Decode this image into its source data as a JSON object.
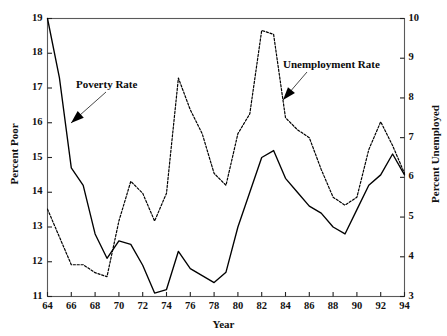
{
  "chart_data": {
    "type": "line",
    "title": "",
    "xlabel": "Year",
    "ylabel": "Percent Poor",
    "ylabel_right": "Percent Unemployed",
    "grid": false,
    "legend_position": "inline-annotations",
    "xlim": [
      64,
      94
    ],
    "ylim": [
      11,
      19
    ],
    "ylim_right": [
      3,
      10
    ],
    "xticks": [
      "64",
      "66",
      "68",
      "70",
      "72",
      "74",
      "76",
      "78",
      "80",
      "82",
      "84",
      "86",
      "88",
      "90",
      "92",
      "94"
    ],
    "yticks_left": [
      "11",
      "12",
      "13",
      "14",
      "15",
      "16",
      "17",
      "18",
      "19"
    ],
    "yticks_right": [
      "3",
      "4",
      "5",
      "6",
      "7",
      "8",
      "9",
      "10"
    ],
    "x": [
      1964,
      1965,
      1966,
      1967,
      1968,
      1969,
      1970,
      1971,
      1972,
      1973,
      1974,
      1975,
      1976,
      1977,
      1978,
      1979,
      1980,
      1981,
      1982,
      1983,
      1984,
      1985,
      1986,
      1987,
      1988,
      1989,
      1990,
      1991,
      1992,
      1993,
      1994
    ],
    "series": [
      {
        "name": "Poverty Rate",
        "axis": "left",
        "style": "solid",
        "color": "#000000",
        "values": [
          19.0,
          17.3,
          14.7,
          14.2,
          12.8,
          12.1,
          12.6,
          12.5,
          11.9,
          11.1,
          11.2,
          12.3,
          11.8,
          11.6,
          11.4,
          11.7,
          13.0,
          14.0,
          15.0,
          15.2,
          14.4,
          14.0,
          13.6,
          13.4,
          13.0,
          12.8,
          13.5,
          14.2,
          14.5,
          15.1,
          14.5
        ]
      },
      {
        "name": "Unemployment Rate",
        "axis": "right",
        "style": "dashed",
        "color": "#000000",
        "values": [
          5.2,
          4.5,
          3.8,
          3.8,
          3.6,
          3.5,
          4.9,
          5.9,
          5.6,
          4.9,
          5.6,
          8.5,
          7.7,
          7.1,
          6.1,
          5.8,
          7.1,
          7.6,
          9.7,
          9.6,
          7.5,
          7.2,
          7.0,
          6.2,
          5.5,
          5.3,
          5.5,
          6.7,
          7.4,
          6.8,
          6.1
        ]
      }
    ],
    "annotations": [
      {
        "name": "poverty-rate-label",
        "text": "Poverty Rate",
        "x_px": 76,
        "y_px": 78
      },
      {
        "name": "unemployment-rate-label",
        "text": "Unemployment Rate",
        "x_px": 283,
        "y_px": 58
      }
    ]
  },
  "axes": {
    "left_title": "Percent Poor",
    "right_title": "Percent Unemployed",
    "x_title": "Year"
  },
  "annotations": {
    "poverty": "Poverty Rate",
    "unemployment": "Unemployment Rate"
  }
}
